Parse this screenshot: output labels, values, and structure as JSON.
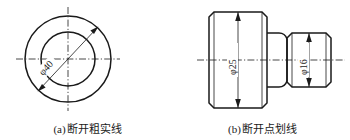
{
  "sheet": {
    "title": "断开线型示例",
    "background_color": "#ffffff",
    "line_color": "#1a1a1a",
    "width": 350,
    "height": 140
  },
  "figures": [
    {
      "key": "a",
      "tag": "(a)",
      "caption": "断开粗实线",
      "caption_full": "(a) 断开粗实线",
      "view_type": "front-circular-view",
      "geometry": {
        "center_x": 68,
        "center_y": 59,
        "outer_radius": 43,
        "inner_radius": 27,
        "centerline_overhang": 9
      },
      "dimensions": [
        {
          "name": "outer-diameter",
          "label": "φ40",
          "symbol": "φ",
          "value": "40",
          "orientation": "diagonal",
          "angle_deg": -45,
          "arrow_count": 2
        }
      ]
    },
    {
      "key": "b",
      "tag": "(b)",
      "caption": "断开点划线",
      "caption_full": "(b) 断开点划线",
      "view_type": "stepped-shaft-profile",
      "geometry": {
        "large_left": 34,
        "large_right": 92,
        "large_top": 12,
        "large_bottom": 108,
        "small_left": 116,
        "small_right": 156,
        "small_top": 33,
        "small_bottom": 87,
        "chamfer": 5,
        "fillet": 6,
        "axis_y": 60
      },
      "dimensions": [
        {
          "name": "large-diameter",
          "label": "φ25",
          "symbol": "φ",
          "value": "25",
          "orientation": "vertical",
          "angle_deg": -90,
          "arrow_count": 2
        },
        {
          "name": "small-diameter",
          "label": "φ16",
          "symbol": "φ",
          "value": "16",
          "orientation": "vertical",
          "angle_deg": -90,
          "arrow_count": 2
        }
      ]
    }
  ],
  "legend": {
    "line_types": [
      {
        "name": "thick-solid-line",
        "label": "粗实线"
      },
      {
        "name": "dash-dot-line",
        "label": "点划线"
      }
    ]
  }
}
